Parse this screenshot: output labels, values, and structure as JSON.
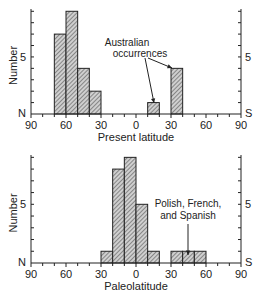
{
  "chart_data": [
    {
      "type": "bar",
      "title": "",
      "xlabel": "Present latitude",
      "ylabel": "Number",
      "x_ticks": [
        "90",
        "60",
        "30",
        "0",
        "30",
        "60",
        "90"
      ],
      "x_range": [
        -90,
        90
      ],
      "ylim": [
        0,
        9
      ],
      "y_tick_labels": {
        "5": "5"
      },
      "left_end_label": "N",
      "right_end_label": "S",
      "right_tick_label": "5",
      "bins": [
        {
          "from": -70,
          "to": -60,
          "value": 7
        },
        {
          "from": -60,
          "to": -50,
          "value": 9
        },
        {
          "from": -50,
          "to": -40,
          "value": 4
        },
        {
          "from": -40,
          "to": -30,
          "value": 2
        },
        {
          "from": 10,
          "to": 20,
          "value": 1
        },
        {
          "from": 30,
          "to": 40,
          "value": 4
        }
      ],
      "annotation": {
        "text_lines": [
          "Australian",
          "occurrences"
        ],
        "points_to": [
          15,
          35
        ]
      }
    },
    {
      "type": "bar",
      "title": "",
      "xlabel": "Paleolatitude",
      "ylabel": "Number",
      "x_ticks": [
        "90",
        "60",
        "30",
        "0",
        "30",
        "60",
        "90"
      ],
      "x_range": [
        -90,
        90
      ],
      "ylim": [
        0,
        9
      ],
      "y_tick_labels": {
        "5": "5"
      },
      "left_end_label": "N",
      "right_end_label": "S",
      "right_tick_label": "5",
      "bins": [
        {
          "from": -30,
          "to": -20,
          "value": 1
        },
        {
          "from": -20,
          "to": -10,
          "value": 8
        },
        {
          "from": -10,
          "to": 0,
          "value": 9
        },
        {
          "from": 0,
          "to": 10,
          "value": 5
        },
        {
          "from": 10,
          "to": 20,
          "value": 1
        },
        {
          "from": 30,
          "to": 40,
          "value": 1
        },
        {
          "from": 40,
          "to": 50,
          "value": 1
        },
        {
          "from": 50,
          "to": 60,
          "value": 1
        }
      ],
      "annotation": {
        "text_lines": [
          "Polish, French,",
          "and Spanish"
        ],
        "points_to": [
          45
        ]
      }
    }
  ]
}
